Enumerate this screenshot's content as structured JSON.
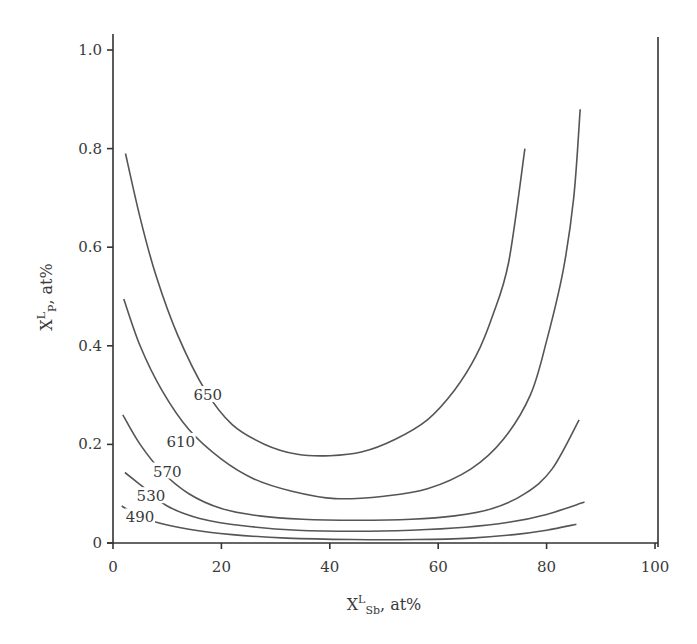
{
  "chart_data": {
    "type": "line",
    "title": "",
    "xlabel": "X^L_Sb, at%",
    "ylabel": "X^L_P, at%",
    "xlabel_parts": {
      "base": "X",
      "sup": "L",
      "sub": "Sb",
      "suffix": ", at%"
    },
    "ylabel_parts": {
      "base": "X",
      "sup": "L",
      "sub": "P",
      "suffix": ", at%"
    },
    "xlim": [
      0,
      100
    ],
    "ylim": [
      0,
      1.0
    ],
    "xticks": [
      0,
      20,
      40,
      60,
      80,
      100
    ],
    "xtick_labels": [
      "0",
      "20",
      "40",
      "60",
      "80",
      "100"
    ],
    "yticks": [
      0,
      0.2,
      0.4,
      0.6,
      0.8,
      1.0
    ],
    "ytick_labels": [
      "0",
      "0.2",
      "0.4",
      "0.6",
      "0.8",
      "1.0"
    ],
    "grid": false,
    "legend": "none (inline contour labels)",
    "series": [
      {
        "name": "650",
        "label_pos": [
          17.5,
          0.3
        ],
        "x": [
          2.3,
          5,
          8,
          12,
          17,
          22,
          28,
          34,
          40,
          46,
          52,
          58,
          63,
          67,
          70,
          73,
          76
        ],
        "y": [
          0.79,
          0.66,
          0.54,
          0.42,
          0.31,
          0.24,
          0.2,
          0.18,
          0.177,
          0.185,
          0.21,
          0.25,
          0.31,
          0.38,
          0.46,
          0.57,
          0.8
        ]
      },
      {
        "name": "610",
        "label_pos": [
          12.5,
          0.205
        ],
        "x": [
          2,
          5,
          9,
          14,
          20,
          26,
          33,
          41,
          50,
          58,
          66,
          72,
          77,
          80,
          83,
          85,
          86.2
        ],
        "y": [
          0.495,
          0.4,
          0.31,
          0.23,
          0.17,
          0.13,
          0.105,
          0.09,
          0.095,
          0.11,
          0.15,
          0.21,
          0.3,
          0.41,
          0.55,
          0.7,
          0.88
        ]
      },
      {
        "name": "570",
        "label_pos": [
          10,
          0.145
        ],
        "x": [
          1.8,
          5,
          9,
          14,
          20,
          27,
          35,
          45,
          55,
          63,
          70,
          76,
          81,
          86
        ],
        "y": [
          0.26,
          0.2,
          0.145,
          0.1,
          0.07,
          0.055,
          0.048,
          0.046,
          0.048,
          0.055,
          0.07,
          0.1,
          0.15,
          0.25
        ]
      },
      {
        "name": "530",
        "label_pos": [
          7,
          0.095
        ],
        "x": [
          2.2,
          6,
          10,
          16,
          24,
          34,
          45,
          55,
          65,
          73,
          80,
          87
        ],
        "y": [
          0.143,
          0.11,
          0.075,
          0.05,
          0.035,
          0.026,
          0.024,
          0.026,
          0.032,
          0.042,
          0.058,
          0.083
        ]
      },
      {
        "name": "490",
        "label_pos": [
          5,
          0.052
        ],
        "x": [
          1.6,
          4,
          8,
          14,
          22,
          32,
          44,
          56,
          66,
          74,
          80,
          85.5
        ],
        "y": [
          0.075,
          0.06,
          0.042,
          0.028,
          0.017,
          0.01,
          0.007,
          0.007,
          0.01,
          0.017,
          0.026,
          0.038
        ]
      }
    ]
  }
}
